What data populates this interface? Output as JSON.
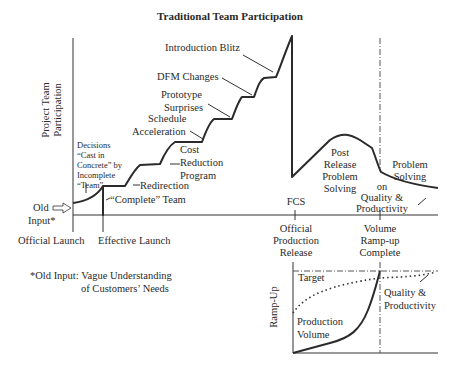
{
  "title": "Traditional Team Participation",
  "main_chart": {
    "y_axis_label": [
      "Project Team",
      "Participation"
    ],
    "x_axis_milestones": [
      {
        "label": [
          "Official Launch"
        ]
      },
      {
        "label": [
          "Effective Launch"
        ]
      },
      {
        "label": [
          "Official",
          "Production",
          "Release"
        ],
        "marker": "FCS"
      },
      {
        "label": [
          "Volume",
          "Ramp-up",
          "Complete"
        ]
      }
    ],
    "input_label": [
      "Old",
      "Input*"
    ],
    "annotations": {
      "decisions": [
        "Decisions",
        "“Cast in",
        "Concrete” by",
        "Incomplete",
        "“Team”"
      ],
      "complete_team": "“Complete” Team",
      "redirection": "Redirection",
      "cost_reduction": [
        "Cost",
        "Reduction",
        "Program"
      ],
      "schedule_acceleration": [
        "Schedule",
        "Acceleration"
      ],
      "prototype_surprises": [
        "Prototype",
        "Surprises"
      ],
      "dfm_changes": "DFM Changes",
      "introduction_blitz": "Introduction Blitz",
      "post_release": [
        "Post",
        "Release",
        "Problem",
        "Solving"
      ],
      "problem_solving_quality": [
        "Problem",
        "Solving",
        "on",
        "Quality &",
        "Productivity"
      ],
      "fcs": "FCS"
    }
  },
  "footnote": [
    "*Old Input: Vague Understanding",
    "of Customers’ Needs"
  ],
  "ramp_chart": {
    "y_axis_label": "Ramp-Up",
    "target_label": "Target",
    "production_volume_label": [
      "Production",
      "Volume"
    ],
    "quality_label": [
      "Quality &",
      "Productivity"
    ]
  }
}
